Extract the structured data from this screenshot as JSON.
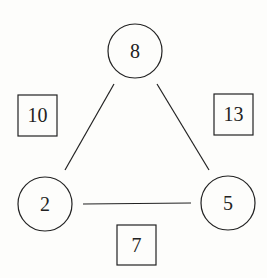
{
  "diagram": {
    "nodes": [
      {
        "id": "top",
        "value": "8",
        "cx": 135,
        "cy": 51,
        "r": 27
      },
      {
        "id": "left",
        "value": "2",
        "cx": 45,
        "cy": 204,
        "r": 27
      },
      {
        "id": "right",
        "value": "5",
        "cx": 228,
        "cy": 203,
        "r": 27
      }
    ],
    "edge_labels": [
      {
        "id": "left-edge",
        "value": "10",
        "x": 18,
        "y": 95,
        "w": 39,
        "h": 41
      },
      {
        "id": "right-edge",
        "value": "13",
        "x": 214,
        "y": 94,
        "w": 39,
        "h": 41
      },
      {
        "id": "bottom-edge",
        "value": "7",
        "x": 117,
        "y": 225,
        "w": 39,
        "h": 40
      }
    ],
    "colors": {
      "stroke": "#222222",
      "background": "#fdfdfb"
    }
  }
}
